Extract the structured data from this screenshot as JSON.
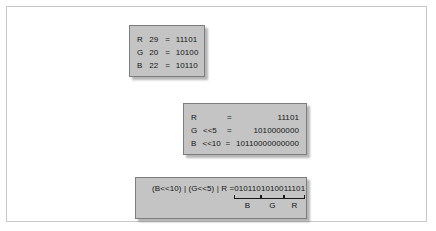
{
  "box_values": {
    "rows": [
      {
        "channel": "R",
        "decimal": "29",
        "equals": "=",
        "binary": "11101"
      },
      {
        "channel": "G",
        "decimal": "20",
        "equals": "=",
        "binary": "10100"
      },
      {
        "channel": "B",
        "decimal": "22",
        "equals": "=",
        "binary": "10110"
      }
    ]
  },
  "box_shifts": {
    "rows": [
      {
        "channel": "R",
        "shift": "",
        "equals": "=",
        "binary": "11101"
      },
      {
        "channel": "G",
        "shift": "<<5",
        "equals": "=",
        "binary": "1010000000"
      },
      {
        "channel": "B",
        "shift": "<<10",
        "equals": "=",
        "binary": "10110000000000"
      }
    ]
  },
  "box_combined": {
    "expression": "(B<<10) | (G<<5) | R =",
    "groups": [
      {
        "digits": "010110",
        "label": "B"
      },
      {
        "digits": "10100",
        "label": "G"
      },
      {
        "digits": "11101",
        "label": "R"
      }
    ]
  },
  "colors": {
    "box_fill": "#c4c4c4",
    "box_border": "#7d7d7d",
    "frame_border": "#c8c8c8",
    "page_background": "#ffffff",
    "text": "#141414"
  }
}
